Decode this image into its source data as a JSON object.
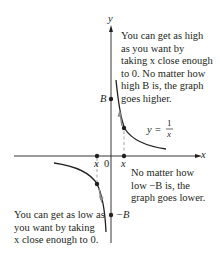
{
  "diagram": {
    "type": "function-graph",
    "function": "y = 1/x",
    "axes": {
      "x_label": "x",
      "y_label": "y",
      "origin_label": "0"
    },
    "marks": {
      "B": "B",
      "neg_B": "−B",
      "x_pos": "x",
      "x_neg": "x"
    },
    "equation": {
      "lhs": "y =",
      "numerator": "1",
      "denominator": "x"
    },
    "annotations": {
      "top_right": {
        "lines": [
          "You can get as high",
          "as you want by",
          "taking x close enough",
          "to 0.  No  matter how",
          "high B is, the graph",
          "goes higher."
        ]
      },
      "bottom_right": {
        "lines": [
          "No matter how",
          "low −B is,  the",
          "graph goes lower."
        ]
      },
      "bottom_left": {
        "lines": [
          "You can get as low as",
          "you want by taking",
          "x close enough to 0."
        ]
      }
    },
    "colors": {
      "ink": "#231f20",
      "arrow_gray": "#8a8a8a",
      "dash_gray": "#9a9a9a"
    }
  }
}
